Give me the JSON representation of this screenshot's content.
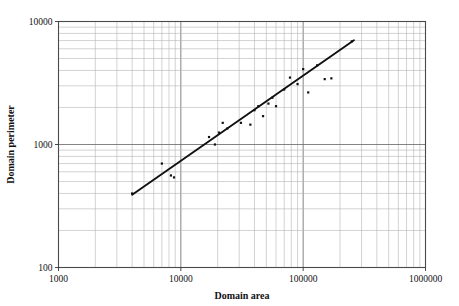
{
  "chart_data": {
    "type": "scatter",
    "title": "",
    "xlabel": "Domain area",
    "ylabel": "Domain perimeter",
    "xscale": "log",
    "yscale": "log",
    "xlim": [
      1000,
      1000000
    ],
    "ylim": [
      100,
      10000
    ],
    "xticks": [
      "1000",
      "10000",
      "100000",
      "1000000"
    ],
    "yticks": [
      "100",
      "1000",
      "10000"
    ],
    "grid": true,
    "minor_grid": true,
    "legend": "none",
    "points": [
      {
        "x": 4000,
        "y": 400
      },
      {
        "x": 7000,
        "y": 700
      },
      {
        "x": 8300,
        "y": 560
      },
      {
        "x": 8800,
        "y": 540
      },
      {
        "x": 17000,
        "y": 1150
      },
      {
        "x": 19000,
        "y": 1000
      },
      {
        "x": 20500,
        "y": 1250
      },
      {
        "x": 22000,
        "y": 1500
      },
      {
        "x": 24000,
        "y": 1350
      },
      {
        "x": 31000,
        "y": 1500
      },
      {
        "x": 37000,
        "y": 1450
      },
      {
        "x": 40000,
        "y": 1900
      },
      {
        "x": 43000,
        "y": 2050
      },
      {
        "x": 47000,
        "y": 1700
      },
      {
        "x": 52000,
        "y": 2150
      },
      {
        "x": 56000,
        "y": 2400
      },
      {
        "x": 60000,
        "y": 2050
      },
      {
        "x": 70000,
        "y": 2800
      },
      {
        "x": 78000,
        "y": 3500
      },
      {
        "x": 90000,
        "y": 3100
      },
      {
        "x": 100000,
        "y": 4100
      },
      {
        "x": 110000,
        "y": 2650
      },
      {
        "x": 130000,
        "y": 4400
      },
      {
        "x": 150000,
        "y": 3400
      },
      {
        "x": 170000,
        "y": 3450
      },
      {
        "x": 250000,
        "y": 6900
      }
    ],
    "fit_line": {
      "label": "regression-line",
      "x0": 4000,
      "y0": 390,
      "x1": 260000,
      "y1": 7050
    }
  },
  "axes": {
    "x_title": "Domain area",
    "y_title": "Domain perimeter"
  }
}
